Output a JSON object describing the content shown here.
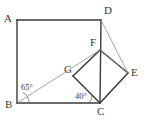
{
  "figure": {
    "canvas": {
      "width": 148,
      "height": 121,
      "background": "#ffffff"
    },
    "style": {
      "stroke_dark": "#3a3a3a",
      "stroke_light": "#8e8e8e",
      "label_color": "#3a3a3a",
      "thick_width": "1.5",
      "thin_width": "0.8"
    },
    "vertices": {
      "A": {
        "label": "A",
        "x": 17,
        "y": 20,
        "label_x": 4,
        "label_y": 13
      },
      "B": {
        "label": "B",
        "x": 17,
        "y": 103,
        "label_x": 5,
        "label_y": 100
      },
      "C": {
        "label": "C",
        "x": 100,
        "y": 103,
        "label_x": 97,
        "label_y": 105
      },
      "D": {
        "label": "D",
        "x": 101,
        "y": 20,
        "label_x": 104,
        "label_y": 6
      },
      "E": {
        "label": "E",
        "x": 128,
        "y": 73,
        "label_x": 131,
        "label_y": 68
      },
      "F": {
        "label": "F",
        "x": 100,
        "y": 50,
        "label_x": 90,
        "label_y": 38
      },
      "G": {
        "label": "G",
        "x": 73,
        "y": 76,
        "label_x": 65,
        "label_y": 65
      }
    },
    "angles": [
      {
        "name": "angle-at-B",
        "label": "65°",
        "label_x": 21,
        "label_y": 84,
        "vertex": "B"
      },
      {
        "name": "angle-at-C",
        "label": "40°",
        "label_x": 76,
        "label_y": 92,
        "vertex": "C"
      }
    ],
    "segments": [
      {
        "name": "segment-AD",
        "from": "A",
        "to": "D",
        "weight": "thick"
      },
      {
        "name": "segment-AB",
        "from": "A",
        "to": "B",
        "weight": "thick"
      },
      {
        "name": "segment-BC",
        "from": "B",
        "to": "C",
        "weight": "thick"
      },
      {
        "name": "segment-DC",
        "from": "D",
        "to": "C",
        "weight": "thick"
      },
      {
        "name": "segment-FG",
        "from": "F",
        "to": "G",
        "weight": "thick"
      },
      {
        "name": "segment-GC",
        "from": "G",
        "to": "C",
        "weight": "thick"
      },
      {
        "name": "segment-CE",
        "from": "C",
        "to": "E",
        "weight": "thick"
      },
      {
        "name": "segment-EF",
        "from": "E",
        "to": "F",
        "weight": "thick"
      },
      {
        "name": "segment-BG",
        "from": "B",
        "to": "G",
        "weight": "thin"
      },
      {
        "name": "segment-DE",
        "from": "D",
        "to": "E",
        "weight": "thin"
      },
      {
        "name": "segment-FE-light",
        "from": "F",
        "to": "E",
        "weight": "thin"
      }
    ]
  }
}
